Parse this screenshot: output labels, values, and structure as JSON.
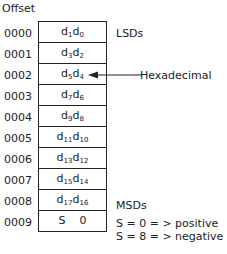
{
  "title": "Offset",
  "rows": [
    {
      "offset": "0000",
      "d": "d",
      "a": "1",
      "b": "0"
    },
    {
      "offset": "0001",
      "d": "d",
      "a": "3",
      "b": "2"
    },
    {
      "offset": "0002",
      "d": "d",
      "a": "5",
      "b": "4"
    },
    {
      "offset": "0003",
      "d": "d",
      "a": "7",
      "b": "6"
    },
    {
      "offset": "0004",
      "d": "d",
      "a": "9",
      "b": "8"
    },
    {
      "offset": "0005",
      "d": "d",
      "a": "11",
      "b": "10"
    },
    {
      "offset": "0006",
      "d": "d",
      "a": "13",
      "b": "12"
    },
    {
      "offset": "0007",
      "d": "d",
      "a": "15",
      "b": "14"
    },
    {
      "offset": "0008",
      "d": "d",
      "a": "17",
      "b": "16"
    }
  ],
  "last_row": {
    "offset": "0009",
    "content": "S    0"
  },
  "labels": {
    "lsd": "LSDs",
    "msd": "MSDs",
    "hex": "Hexadecimal",
    "pos": "S = 0 = > positive",
    "neg": "S = 8 = > negative"
  }
}
